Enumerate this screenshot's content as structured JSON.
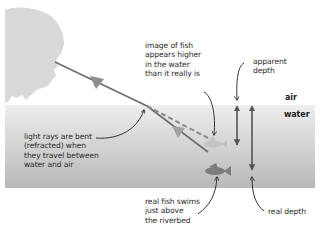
{
  "diagram": {
    "title": "",
    "labels": {
      "image_of_fish": "image of fish\nappears higher\nin the water\nthan it really is",
      "apparent_depth": "apparent\ndepth",
      "air": "air",
      "water": "water",
      "light_rays": "light rays are bent\n(refracted) when\nthey travel between\nwater and air",
      "real_fish": "real fish swims\njust above\nthe riverbed",
      "real_depth": "real depth"
    },
    "colors": {
      "head": "#d9d9d9",
      "water_top": "#ececec",
      "water_bottom": "#b9b9b9",
      "ray": "#6f6f6f",
      "arrow_fill": "#8c8c8c",
      "apparent_fish": "#c2c2c2",
      "real_fish": "#7f7f7f",
      "depth_arrows": "#555555",
      "pointer": "#333333"
    }
  }
}
